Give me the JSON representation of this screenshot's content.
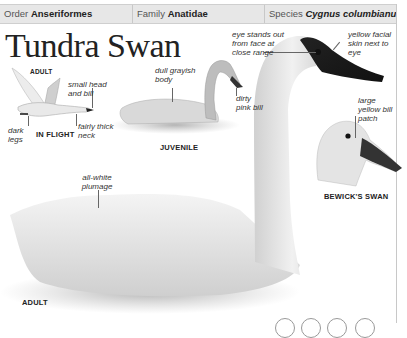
{
  "header": {
    "order": {
      "label": "Order",
      "value": "Anseriformes"
    },
    "family": {
      "label": "Family",
      "value": "Anatidae"
    },
    "species": {
      "label": "Species",
      "value": "Cygnus columbianus"
    }
  },
  "title": "Tundra Swan",
  "images": {
    "in_flight": {
      "caption": "IN FLIGHT",
      "sub_caption": "ADULT",
      "labels": [
        "small head and bill",
        "fairly thick neck",
        "dark legs"
      ]
    },
    "juvenile": {
      "caption": "JUVENILE",
      "labels": [
        "dull grayish body",
        "dirty pink bill"
      ]
    },
    "adult": {
      "caption": "ADULT",
      "labels": [
        "eye stands out from face at close range",
        "yellow facial skin next to eye",
        "all-white plumage"
      ]
    },
    "bewicks": {
      "caption": "BEWICK'S SWAN",
      "labels": [
        "large yellow bill patch"
      ]
    }
  },
  "colors": {
    "header_bg": "#e7e7e7",
    "border": "#c8c8c8",
    "text": "#222222"
  }
}
